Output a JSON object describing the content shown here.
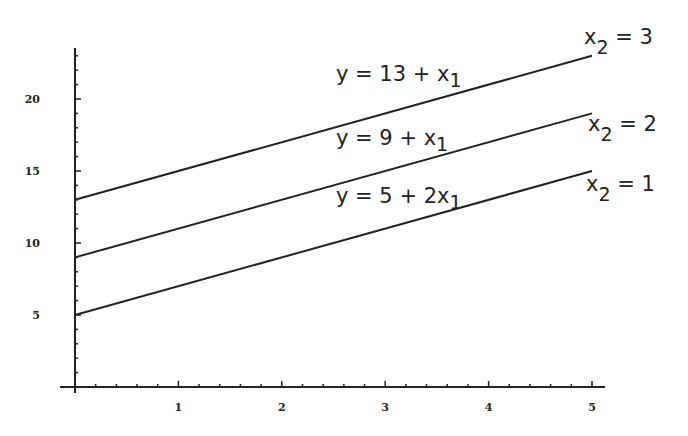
{
  "chart_data": {
    "type": "line",
    "title": "",
    "xlabel": "",
    "ylabel": "",
    "xlim": [
      0,
      5
    ],
    "ylim": [
      0,
      23
    ],
    "grid": false,
    "x_ticks": [
      1,
      2,
      3,
      4,
      5
    ],
    "y_ticks": [
      5,
      10,
      15,
      20
    ],
    "x": [
      0,
      5
    ],
    "series": [
      {
        "name": "x2 = 3",
        "equation": "y = 13 + x1",
        "values": [
          13,
          23
        ]
      },
      {
        "name": "x2 = 2",
        "equation": "y = 9 + x1",
        "values": [
          9,
          19
        ]
      },
      {
        "name": "x2 = 1",
        "equation": "y = 5 + 2x1",
        "values": [
          5,
          15
        ]
      }
    ]
  },
  "labels": {
    "eq3": {
      "main": "y = 13 + x",
      "sub": "1"
    },
    "eq2": {
      "main": "y = 9 + x",
      "sub": "1"
    },
    "eq1": {
      "main": "y = 5 + 2x",
      "sub": "1"
    },
    "x2_3": {
      "x": "x",
      "sub": "2",
      "rest": " = 3"
    },
    "x2_2": {
      "x": "x",
      "sub": "2",
      "rest": " = 2"
    },
    "x2_1": {
      "x": "x",
      "sub": "2",
      "rest": " = 1"
    }
  },
  "ticks": {
    "x": [
      "1",
      "2",
      "3",
      "4",
      "5"
    ],
    "y": [
      "5",
      "10",
      "15",
      "20"
    ]
  }
}
